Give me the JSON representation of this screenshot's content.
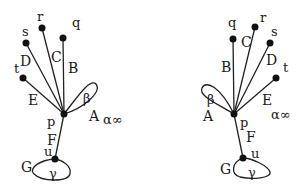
{
  "diagrams": [
    {
      "id": "left",
      "vertex_labels": {
        "p": "p",
        "q": "q",
        "r": "r",
        "s": "s",
        "t": "t",
        "u": "u"
      },
      "edge_labels": {
        "A": "A",
        "B": "B",
        "C": "C",
        "D": "D",
        "E": "E",
        "F": "F",
        "G": "G"
      },
      "loop_labels": {
        "beta": "β",
        "gamma": "γ"
      },
      "extra_label": "α∞"
    },
    {
      "id": "right",
      "vertex_labels": {
        "p": "p",
        "q": "q",
        "r": "r",
        "s": "s",
        "t": "t",
        "u": "u"
      },
      "edge_labels": {
        "A": "A",
        "B": "B",
        "C": "C",
        "D": "D",
        "E": "E",
        "F": "F",
        "G": "G"
      },
      "loop_labels": {
        "beta": "β",
        "gamma": "γ"
      },
      "extra_label": "α∞"
    }
  ]
}
